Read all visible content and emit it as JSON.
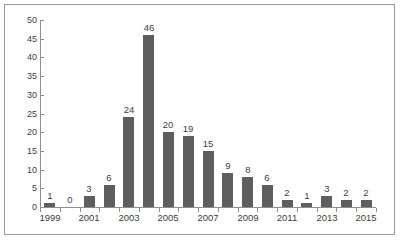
{
  "chart_data": {
    "type": "bar",
    "title": "",
    "subtitle": "",
    "xlabel": "",
    "ylabel": "",
    "ylim": [
      0,
      50
    ],
    "ytick_step": 5,
    "yticks": [
      0,
      5,
      10,
      15,
      20,
      25,
      30,
      35,
      40,
      45,
      50
    ],
    "ytick_labels": [
      "0",
      "5",
      "10",
      "15",
      "20",
      "25",
      "30",
      "35",
      "40",
      "45",
      "50"
    ],
    "grid": false,
    "legend": null,
    "legend_position": "none",
    "categories": [
      "1999",
      "2000",
      "2001",
      "2002",
      "2003",
      "2004",
      "2005",
      "2006",
      "2007",
      "2008",
      "2009",
      "2010",
      "2011",
      "2012",
      "2013",
      "2014",
      "2015"
    ],
    "xtick_labels_shown": [
      "1999",
      "",
      "2001",
      "",
      "2003",
      "",
      "2005",
      "",
      "2007",
      "",
      "2009",
      "",
      "2011",
      "",
      "2013",
      "",
      "2015"
    ],
    "values": [
      1,
      0,
      3,
      6,
      24,
      46,
      20,
      19,
      15,
      9,
      8,
      6,
      2,
      1,
      3,
      2,
      2
    ],
    "data_labels": [
      "1",
      "0",
      "3",
      "6",
      "24",
      "46",
      "20",
      "19",
      "15",
      "9",
      "8",
      "6",
      "2",
      "1",
      "3",
      "2",
      "2"
    ],
    "series": [
      {
        "name": "",
        "values": [
          1,
          0,
          3,
          6,
          24,
          46,
          20,
          19,
          15,
          9,
          8,
          6,
          2,
          1,
          3,
          2,
          2
        ]
      }
    ]
  },
  "style": {
    "bar_color": "#5e5e5e",
    "axis_color": "#8e8e8e",
    "text_color": "#3d3d3d",
    "frame_color": "#9a9a9a",
    "background": "#ffffff"
  }
}
